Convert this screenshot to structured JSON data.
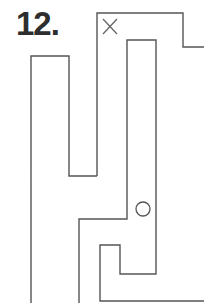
{
  "puzzle": {
    "number_label": "12."
  },
  "maze": {
    "stroke_color": "#555555",
    "start_marker": "x-mark",
    "end_marker": "circle"
  }
}
